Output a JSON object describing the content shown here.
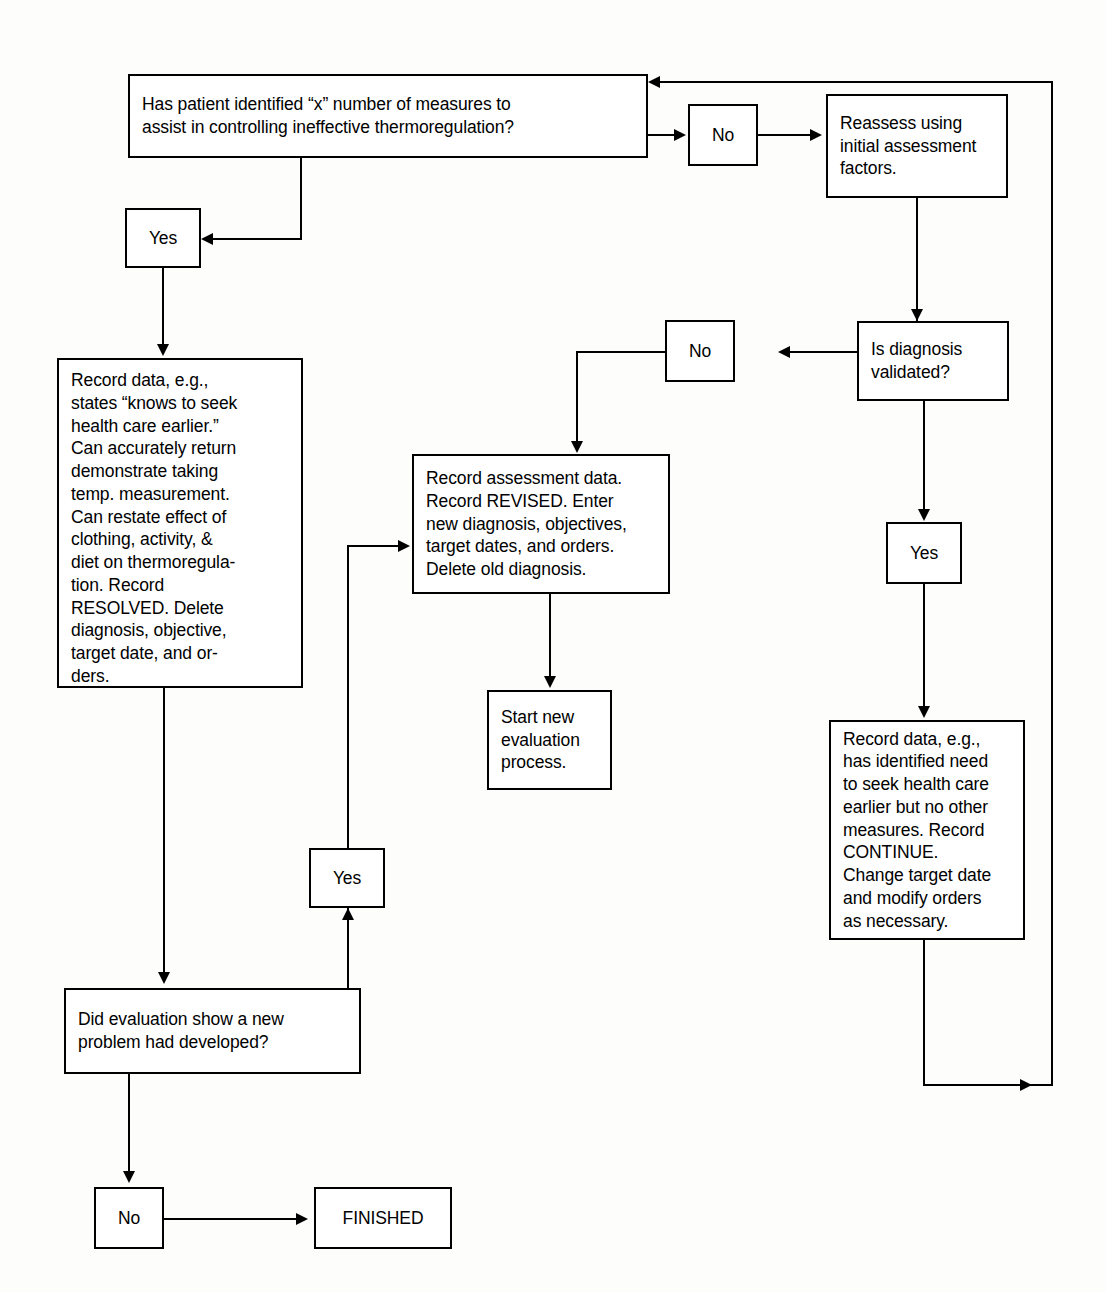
{
  "diagram": {
    "line_color": "#000000",
    "box_fill": "#ffffff",
    "background": "#fdfdfc"
  },
  "nodes": {
    "question_measures": "Has patient identified “x” number of measures to\nassist in controlling ineffective thermoregulation?",
    "no_1": "No",
    "reassess": "Reassess using\ninitial assessment\nfactors.",
    "yes_left": "Yes",
    "record_resolved": "Record data, e.g.,\nstates “knows to seek\nhealth care earlier.”\nCan accurately return\ndemonstrate taking\ntemp. measurement.\nCan restate effect of\nclothing, activity, &\ndiet on thermoregula-\ntion. Record\nRESOLVED. Delete\ndiagnosis, objective,\ntarget date, and or-\nders.",
    "no_2": "No",
    "is_diagnosis_validated": "Is diagnosis\nvalidated?",
    "record_revised": "Record assessment data.\nRecord REVISED. Enter\nnew diagnosis, objectives,\ntarget dates, and orders.\nDelete old diagnosis.",
    "yes_right": "Yes",
    "start_new_evaluation": "Start new\nevaluation\nprocess.",
    "yes_middle": "Yes",
    "record_continue": "Record data, e.g.,\nhas identified need\nto seek health care\nearlier but no other\nmeasures. Record\nCONTINUE.\nChange target date\nand modify orders\nas necessary.",
    "did_evaluation": "Did evaluation show a new\nproblem had developed?",
    "no_3": "No",
    "finished": "FINISHED"
  }
}
